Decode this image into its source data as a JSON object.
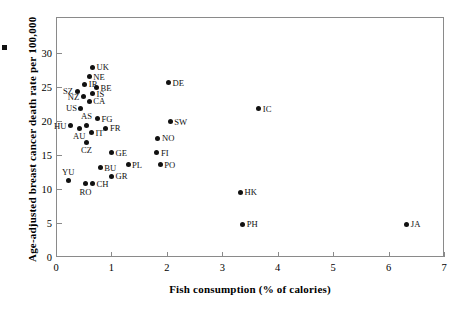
{
  "figure": {
    "background": "#ffffff",
    "frame_color": "#8a8a8a",
    "point_color": "#111111"
  },
  "stray_mark": {
    "name": "edge-artifact"
  },
  "chart_data": {
    "type": "scatter",
    "title": "",
    "xlabel": "Fish consumption (% of calories)",
    "ylabel": "Age-adjusted breast cancer death rate per 100,000",
    "xlim": [
      0,
      7
    ],
    "ylim": [
      0,
      34.5
    ],
    "xticks": [
      0,
      1,
      2,
      3,
      4,
      5,
      6,
      7
    ],
    "xticklabels": [
      "0",
      "1",
      "2",
      "3",
      "4",
      "5",
      "6",
      "7"
    ],
    "yticks": [
      0,
      5,
      10,
      15,
      20,
      25,
      30
    ],
    "yticklabels": [
      "0",
      "5",
      "10",
      "15",
      "20",
      "25",
      "30"
    ],
    "grid": false,
    "legend": null,
    "points": [
      {
        "label": "UK",
        "x": 0.66,
        "y": 27.9,
        "pos": "r"
      },
      {
        "label": "NE",
        "x": 0.6,
        "y": 26.5,
        "pos": "r"
      },
      {
        "label": "IR",
        "x": 0.52,
        "y": 25.4,
        "pos": "r"
      },
      {
        "label": "BE",
        "x": 0.73,
        "y": 24.9,
        "pos": "r"
      },
      {
        "label": "SZ",
        "x": 0.38,
        "y": 24.4,
        "pos": "l"
      },
      {
        "label": "IS",
        "x": 0.66,
        "y": 24.0,
        "pos": "r"
      },
      {
        "label": "NZ",
        "x": 0.49,
        "y": 23.6,
        "pos": "l"
      },
      {
        "label": "CA",
        "x": 0.6,
        "y": 22.9,
        "pos": "r"
      },
      {
        "label": "US",
        "x": 0.45,
        "y": 21.9,
        "pos": "l"
      },
      {
        "label": "FG",
        "x": 0.75,
        "y": 20.3,
        "pos": "r"
      },
      {
        "label": "HU",
        "x": 0.26,
        "y": 19.3,
        "pos": "l"
      },
      {
        "label": "AS",
        "x": 0.55,
        "y": 19.4,
        "pos": "t"
      },
      {
        "label": "AU",
        "x": 0.42,
        "y": 18.9,
        "pos": "b"
      },
      {
        "label": "FR",
        "x": 0.9,
        "y": 18.9,
        "pos": "r"
      },
      {
        "label": "IT",
        "x": 0.64,
        "y": 18.3,
        "pos": "r"
      },
      {
        "label": "CZ",
        "x": 0.55,
        "y": 16.9,
        "pos": "b"
      },
      {
        "label": "GE",
        "x": 1.0,
        "y": 15.3,
        "pos": "r"
      },
      {
        "label": "NO",
        "x": 1.84,
        "y": 17.5,
        "pos": "r"
      },
      {
        "label": "FI",
        "x": 1.82,
        "y": 15.3,
        "pos": "r"
      },
      {
        "label": "PO",
        "x": 1.88,
        "y": 13.6,
        "pos": "r"
      },
      {
        "label": "PL",
        "x": 1.3,
        "y": 13.6,
        "pos": "r"
      },
      {
        "label": "BU",
        "x": 0.8,
        "y": 13.1,
        "pos": "r"
      },
      {
        "label": "GR",
        "x": 1.0,
        "y": 11.9,
        "pos": "r"
      },
      {
        "label": "YU",
        "x": 0.22,
        "y": 11.2,
        "pos": "t"
      },
      {
        "label": "CH",
        "x": 0.66,
        "y": 10.8,
        "pos": "r"
      },
      {
        "label": "RO",
        "x": 0.53,
        "y": 10.8,
        "pos": "b"
      },
      {
        "label": "DE",
        "x": 2.03,
        "y": 25.6,
        "pos": "r"
      },
      {
        "label": "SW",
        "x": 2.06,
        "y": 19.9,
        "pos": "r"
      },
      {
        "label": "IC",
        "x": 3.66,
        "y": 21.8,
        "pos": "r"
      },
      {
        "label": "HK",
        "x": 3.33,
        "y": 9.5,
        "pos": "r"
      },
      {
        "label": "PH",
        "x": 3.37,
        "y": 4.8,
        "pos": "r"
      },
      {
        "label": "JA",
        "x": 6.33,
        "y": 4.8,
        "pos": "r"
      }
    ]
  }
}
